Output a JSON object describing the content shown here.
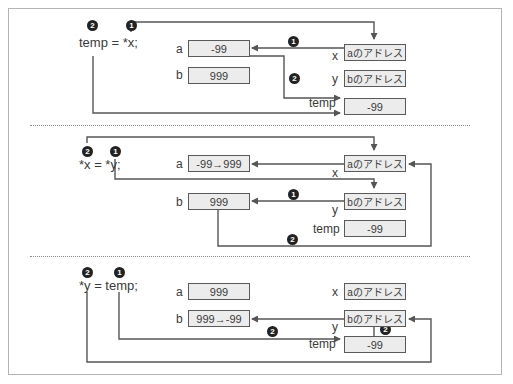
{
  "panels": [
    {
      "code": "temp = *x;",
      "step_markers": [
        "2",
        "1"
      ],
      "vars": {
        "a": {
          "label": "a",
          "value": "-99"
        },
        "b": {
          "label": "b",
          "value": "999"
        },
        "x": {
          "label": "x",
          "value": "aのアドレス"
        },
        "y": {
          "label": "y",
          "value": "bのアドレス"
        },
        "temp": {
          "label": "temp",
          "value": "-99"
        }
      },
      "arrow_markers": [
        "1",
        "2"
      ]
    },
    {
      "code": "*x = *y;",
      "step_markers": [
        "2",
        "1"
      ],
      "vars": {
        "a": {
          "label": "a",
          "value": "-99→999"
        },
        "b": {
          "label": "b",
          "value": "999"
        },
        "x": {
          "label": "x",
          "value": "aのアドレス"
        },
        "y": {
          "label": "y",
          "value": "bのアドレス"
        },
        "temp": {
          "label": "temp",
          "value": "-99"
        }
      },
      "arrow_markers": [
        "1",
        "2"
      ]
    },
    {
      "code": "*y = temp;",
      "step_markers": [
        "2",
        "1"
      ],
      "vars": {
        "a": {
          "label": "a",
          "value": "999"
        },
        "b": {
          "label": "b",
          "value": "999→-99"
        },
        "x": {
          "label": "x",
          "value": "aのアドレス"
        },
        "y": {
          "label": "y",
          "value": "bのアドレス"
        },
        "temp": {
          "label": "temp",
          "value": "-99"
        }
      },
      "arrow_markers": [
        "2",
        "2"
      ]
    }
  ],
  "colors": {
    "line": "#555555",
    "box_fill": "#ececec",
    "marker": "#222222",
    "frame": "#b4b4b4"
  }
}
